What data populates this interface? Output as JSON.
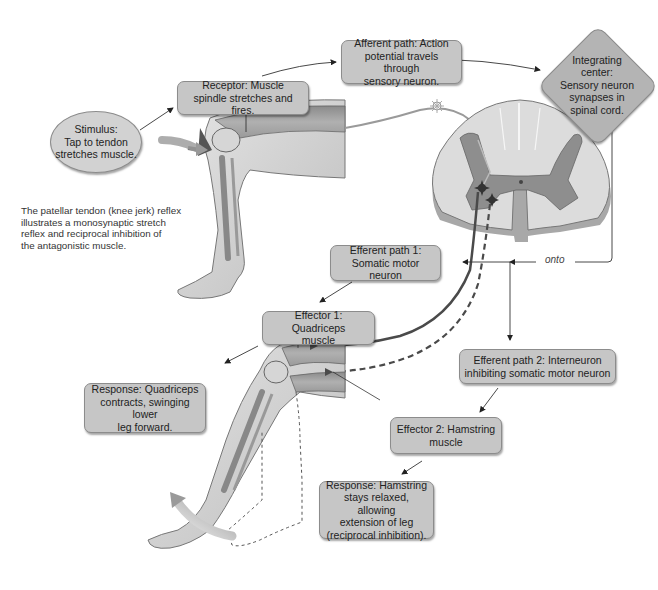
{
  "figure": {
    "title": "Patellar tendon (knee jerk) reflex",
    "caption": "The patellar tendon (knee jerk) reflex\nillustrates a monosynaptic stretch\nreflex and reciprocal inhibition of\nthe antagonistic muscle."
  },
  "nodes": {
    "stimulus": "Stimulus:\nTap to tendon\nstretches muscle.",
    "receptor": "Receptor: Muscle\nspindle stretches and fires.",
    "afferent_path": "Afferent path: Action\npotential travels through\nsensory neuron.",
    "integrating_center": "Integrating\ncenter:\nSensory neuron\nsynapses in\nspinal cord.",
    "efferent_path_1": "Efferent path 1:\nSomatic motor neuron",
    "effector_1": "Effector 1: Quadriceps\nmuscle",
    "response_1": "Response: Quadriceps\ncontracts, swinging lower\nleg forward.",
    "efferent_path_2": "Efferent path 2: Interneuron\ninhibiting somatic motor neuron",
    "effector_2": "Effector 2: Hamstring\nmuscle",
    "response_2": "Response: Hamstring\nstays relaxed, allowing\nextension of leg\n(reciprocal inhibition)."
  },
  "connector_label": "onto",
  "flow": [
    "stimulus -> receptor",
    "receptor -> afferent_path",
    "afferent_path -> integrating_center",
    "integrating_center -> onto -> efferent_path_1",
    "integrating_center -> onto -> efferent_path_2",
    "efferent_path_1 -> effector_1",
    "effector_1 -> response_1",
    "efferent_path_2 -> effector_2",
    "effector_2 -> response_2"
  ],
  "colors": {
    "box_fill": "#c6c6c6",
    "diamond_fill": "#b4b4b4",
    "grey_matter": "#8e8e8e",
    "white_matter": "#d9d9d9",
    "neuron": "#555555"
  }
}
